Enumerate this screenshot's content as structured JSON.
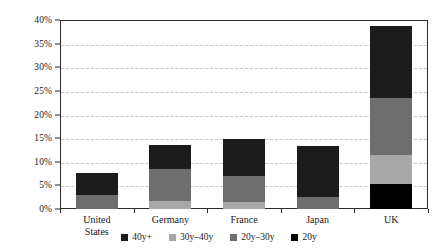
{
  "chart_data": {
    "type": "bar",
    "stacked": true,
    "title": "",
    "xlabel": "",
    "ylabel": "",
    "ylim": [
      0,
      40
    ],
    "ytick_values": [
      0,
      5,
      10,
      15,
      20,
      25,
      30,
      35,
      40
    ],
    "ytick_labels": [
      "0%",
      "5%",
      "10%",
      "15%",
      "20%",
      "25%",
      "30%",
      "35%",
      "40%"
    ],
    "grid": true,
    "grid_style": "dashed",
    "legend_position": "bottom",
    "categories": [
      "United States",
      "Germany",
      "France",
      "Japan",
      "UK"
    ],
    "category_label_lines": [
      [
        "United",
        "States"
      ],
      [
        "Germany"
      ],
      [
        "France"
      ],
      [
        "Japan"
      ],
      [
        "UK"
      ]
    ],
    "series": [
      {
        "name": "20y",
        "color": "#000000",
        "values": [
          0.0,
          0.0,
          0.0,
          0.0,
          5.2
        ]
      },
      {
        "name": "20y–30y",
        "color": "#6e6e6e",
        "values": [
          0.0,
          0.0,
          0.0,
          2.6,
          0.0
        ]
      },
      {
        "name": "30y–40y",
        "color": "#a8a8a8",
        "values": [
          0.0,
          1.7,
          1.5,
          0.0,
          6.3
        ]
      },
      {
        "name": "20y–30y-mid",
        "color": "#6e6e6e",
        "values": [
          2.9,
          6.7,
          5.4,
          0.0,
          12.0
        ]
      },
      {
        "name": "40y+",
        "color": "#1c1c1c",
        "values": [
          4.8,
          5.1,
          7.9,
          10.7,
          15.2
        ]
      }
    ],
    "totals": [
      7.7,
      13.5,
      14.8,
      13.3,
      38.7
    ],
    "annotations": []
  },
  "legend": {
    "items": [
      {
        "label": "40y+",
        "color": "#1c1c1c"
      },
      {
        "label": "30y–40y",
        "color": "#a8a8a8"
      },
      {
        "label": "20y–30y",
        "color": "#6e6e6e"
      },
      {
        "label": "20y",
        "color": "#000000"
      }
    ]
  },
  "colors": {
    "frame": "#2b2b2b",
    "grid": "#c8c8c8",
    "background": "#ffffff",
    "text": "#1a1a1a"
  }
}
